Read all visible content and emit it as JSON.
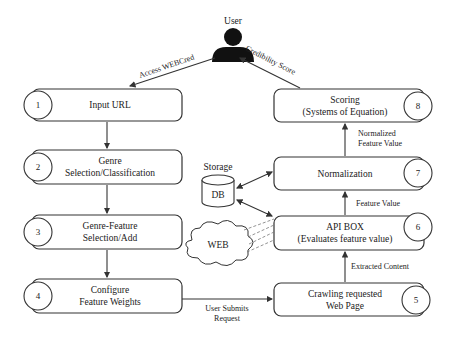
{
  "user": {
    "label": "User"
  },
  "edges": {
    "access": "Access WEBCred",
    "credibility": "Credibility Score",
    "normalized_line1": "Normalized",
    "normalized_line2": "Feature Value",
    "feature_value": "Feature Value",
    "extracted": "Extracted Content",
    "submits_line1": "User Submits",
    "submits_line2": "Request"
  },
  "steps": [
    {
      "num": "1",
      "line1": "Input URL",
      "line2": ""
    },
    {
      "num": "2",
      "line1": "Genre",
      "line2": "Selection/Classification"
    },
    {
      "num": "3",
      "line1": "Genre-Feature",
      "line2": "Selection/Add"
    },
    {
      "num": "4",
      "line1": "Configure",
      "line2": "Feature Weights"
    },
    {
      "num": "5",
      "line1": "Crawling requested",
      "line2": "Web Page"
    },
    {
      "num": "6",
      "line1": "API BOX",
      "line2": "(Evaluates feature value)"
    },
    {
      "num": "7",
      "line1": "Normalization",
      "line2": ""
    },
    {
      "num": "8",
      "line1": "Scoring",
      "line2": "(Systems of Equation)"
    }
  ],
  "storage": {
    "label": "Storage",
    "db": "DB"
  },
  "web": {
    "label": "WEB"
  }
}
